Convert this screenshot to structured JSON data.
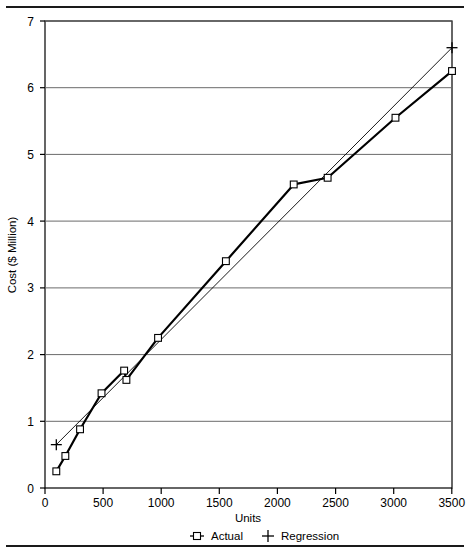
{
  "chart_data": {
    "type": "line",
    "title": "",
    "xlabel": "Units",
    "ylabel": "Cost ($ Million)",
    "xlim": [
      0,
      3600
    ],
    "ylim": [
      0,
      7
    ],
    "grid": true,
    "grid_axis": "y",
    "legend_position": "bottom",
    "xticks": [
      0,
      500,
      1000,
      1500,
      2000,
      2500,
      3000,
      3500
    ],
    "xtick_labels": [
      "0",
      "500",
      "1000",
      "1500",
      "2000",
      "2500",
      "3000",
      "3500"
    ],
    "yticks": [
      0,
      1,
      2,
      3,
      4,
      5,
      6,
      7
    ],
    "ytick_labels": [
      "0",
      "1",
      "2",
      "3",
      "4",
      "5",
      "6",
      "7"
    ],
    "series": [
      {
        "name": "Actual",
        "marker": "square",
        "line_style": "solid-thick",
        "color": "#000000",
        "x": [
          100,
          180,
          310,
          500,
          700,
          720,
          1000,
          1600,
          2200,
          2500,
          3100,
          3600
        ],
        "y": [
          0.25,
          0.48,
          0.88,
          1.42,
          1.76,
          1.62,
          2.25,
          3.4,
          4.55,
          4.65,
          5.55,
          6.25
        ]
      },
      {
        "name": "Regression",
        "marker": "plus",
        "line_style": "solid-thin",
        "color": "#000000",
        "x": [
          100,
          3600
        ],
        "y": [
          0.65,
          6.6
        ]
      }
    ],
    "legend": [
      {
        "label": "Actual",
        "marker": "square-with-line"
      },
      {
        "label": "Regression",
        "marker": "plus"
      }
    ],
    "colors": {
      "axis": "#000000",
      "grid": "#6b6b6b",
      "series_actual": "#000000",
      "series_regression": "#000000",
      "background": "#ffffff"
    }
  }
}
